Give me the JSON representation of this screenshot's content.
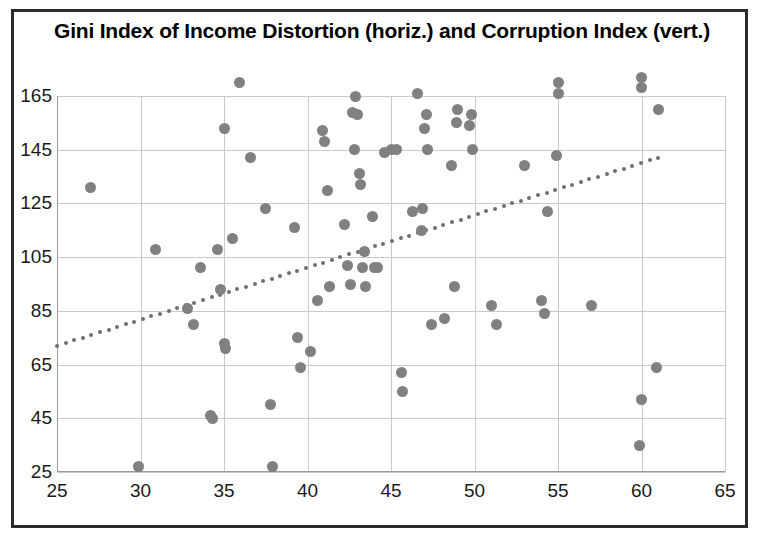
{
  "chart_data": {
    "type": "scatter",
    "title": "Gini Index of Income Distortion (horiz.) and Corruption Index (vert.)",
    "xlabel": "",
    "ylabel": "",
    "xlim": [
      25,
      65
    ],
    "ylim": [
      25,
      175
    ],
    "xticks": [
      25,
      30,
      35,
      40,
      45,
      50,
      55,
      60,
      65
    ],
    "yticks": [
      25,
      45,
      65,
      85,
      105,
      125,
      145,
      165
    ],
    "grid": true,
    "legend": "none",
    "marker_color": "#808080",
    "trendline_color": "#6e6e6e",
    "points": [
      [
        27.0,
        131
      ],
      [
        29.9,
        27
      ],
      [
        30.9,
        108
      ],
      [
        32.8,
        86
      ],
      [
        33.2,
        80
      ],
      [
        33.6,
        101
      ],
      [
        34.2,
        46
      ],
      [
        34.3,
        45
      ],
      [
        34.6,
        108
      ],
      [
        34.8,
        93
      ],
      [
        35.0,
        153
      ],
      [
        35.0,
        73
      ],
      [
        35.1,
        71
      ],
      [
        35.5,
        112
      ],
      [
        35.9,
        170
      ],
      [
        36.6,
        142
      ],
      [
        37.5,
        123
      ],
      [
        37.8,
        50
      ],
      [
        37.9,
        27
      ],
      [
        39.2,
        116
      ],
      [
        39.4,
        75
      ],
      [
        39.6,
        64
      ],
      [
        40.2,
        70
      ],
      [
        40.6,
        89
      ],
      [
        40.9,
        152
      ],
      [
        41.0,
        148
      ],
      [
        41.2,
        130
      ],
      [
        41.3,
        94
      ],
      [
        42.2,
        117
      ],
      [
        42.4,
        102
      ],
      [
        42.6,
        95
      ],
      [
        42.7,
        159
      ],
      [
        42.8,
        145
      ],
      [
        42.9,
        165
      ],
      [
        43.0,
        158
      ],
      [
        43.1,
        136
      ],
      [
        43.2,
        132
      ],
      [
        43.3,
        101
      ],
      [
        43.4,
        107
      ],
      [
        43.5,
        94
      ],
      [
        43.9,
        120
      ],
      [
        44.0,
        101
      ],
      [
        44.2,
        101
      ],
      [
        44.6,
        144
      ],
      [
        45.0,
        145
      ],
      [
        45.3,
        145
      ],
      [
        45.6,
        62
      ],
      [
        45.7,
        55
      ],
      [
        46.3,
        122
      ],
      [
        46.6,
        166
      ],
      [
        46.8,
        115
      ],
      [
        46.9,
        123
      ],
      [
        47.0,
        153
      ],
      [
        47.1,
        158
      ],
      [
        47.2,
        145
      ],
      [
        47.4,
        80
      ],
      [
        48.2,
        82
      ],
      [
        48.6,
        139
      ],
      [
        48.8,
        94
      ],
      [
        48.9,
        155
      ],
      [
        49.0,
        160
      ],
      [
        49.7,
        154
      ],
      [
        49.8,
        158
      ],
      [
        49.9,
        145
      ],
      [
        51.0,
        87
      ],
      [
        51.3,
        80
      ],
      [
        53.0,
        139
      ],
      [
        54.0,
        89
      ],
      [
        54.2,
        84
      ],
      [
        54.4,
        122
      ],
      [
        54.9,
        143
      ],
      [
        55.0,
        170
      ],
      [
        55.0,
        166
      ],
      [
        57.0,
        87
      ],
      [
        59.9,
        35
      ],
      [
        60.0,
        52
      ],
      [
        60.0,
        172
      ],
      [
        60.0,
        168
      ],
      [
        60.9,
        64
      ],
      [
        61.0,
        160
      ]
    ],
    "trendline": {
      "x_start": 25.0,
      "y_start": 72,
      "x_end": 61.0,
      "y_end": 142,
      "style": "dotted"
    }
  }
}
